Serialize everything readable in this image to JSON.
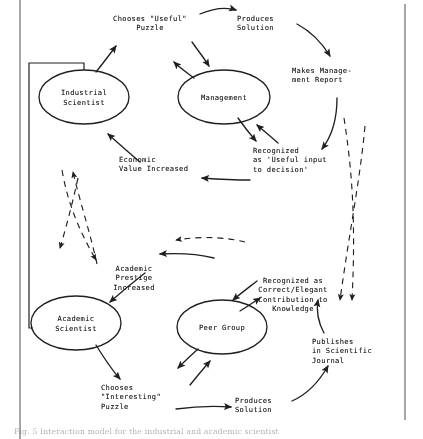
{
  "figure": {
    "background": "#ffffff",
    "ink_color": "#23211f",
    "width": 423,
    "height": 439
  },
  "nodes": [
    {
      "id": "industrial-scientist",
      "label": "Industrial\nScientist",
      "cx": 84,
      "cy": 97,
      "rx": 45,
      "ry": 27
    },
    {
      "id": "management",
      "label": "Management",
      "cx": 224,
      "cy": 97,
      "rx": 46,
      "ry": 27
    },
    {
      "id": "academic-scientist",
      "label": "Academic\nScientist",
      "cx": 76,
      "cy": 323,
      "rx": 45,
      "ry": 27
    },
    {
      "id": "peer-group",
      "label": "Peer Group",
      "cx": 222,
      "cy": 327,
      "rx": 45,
      "ry": 27
    }
  ],
  "labels": [
    {
      "id": "chooses-useful-puzzle",
      "text": "Chooses \"Useful\"\nPuzzle",
      "x": 102,
      "y": 14,
      "w": 96,
      "align": "center"
    },
    {
      "id": "produces-solution-top",
      "text": "Produces\nSolution",
      "x": 237,
      "y": 14,
      "w": 56,
      "align": "left"
    },
    {
      "id": "makes-management-report",
      "text": "Makes Manage-\nment Report",
      "x": 292,
      "y": 66,
      "w": 92,
      "align": "left"
    },
    {
      "id": "recognized-useful-input",
      "text": "Recognized\nas 'Useful input\nto decision'",
      "x": 253,
      "y": 146,
      "w": 100,
      "align": "left"
    },
    {
      "id": "economic-value-increased",
      "text": "Economic\nValue Increased",
      "x": 119,
      "y": 155,
      "w": 96,
      "align": "left"
    },
    {
      "id": "academic-prestige",
      "text": "Academic\nPrestige\nIncreased",
      "x": 98,
      "y": 264,
      "w": 70,
      "align": "center"
    },
    {
      "id": "recognized-correct",
      "text": "Recognized as\nCorrect/Elegant\nContribution to\nKnowledge",
      "x": 241,
      "y": 276,
      "w": 100,
      "align": "center"
    },
    {
      "id": "publishes-journal",
      "text": "Publishes\nin Scientific\nJournal",
      "x": 312,
      "y": 337,
      "w": 82,
      "align": "left"
    },
    {
      "id": "chooses-interesting",
      "text": "Chooses\n\"Interesting\"\nPuzzle",
      "x": 101,
      "y": 383,
      "w": 86,
      "align": "left"
    },
    {
      "id": "produces-solution-bottom",
      "text": "Produces\nSolution",
      "x": 235,
      "y": 396,
      "w": 56,
      "align": "left"
    }
  ],
  "caption": {
    "text": "Fig. 5  Interaction model for the industrial and academic scientist"
  },
  "flows": [
    {
      "from": "industrial-scientist",
      "to": "chooses-useful-puzzle",
      "style": "solid"
    },
    {
      "from": "chooses-useful-puzzle",
      "to": "produces-solution-top",
      "style": "solid"
    },
    {
      "from": "produces-solution-top",
      "to": "makes-management-report",
      "style": "solid"
    },
    {
      "from": "management",
      "to": "chooses-useful-puzzle",
      "style": "solid"
    },
    {
      "from": "chooses-useful-puzzle",
      "to": "management",
      "style": "solid"
    },
    {
      "from": "makes-management-report",
      "to": "recognized-useful-input",
      "style": "solid"
    },
    {
      "from": "management",
      "to": "recognized-useful-input",
      "style": "solid"
    },
    {
      "from": "recognized-useful-input",
      "to": "management",
      "style": "solid"
    },
    {
      "from": "recognized-useful-input",
      "to": "economic-value-increased",
      "style": "solid"
    },
    {
      "from": "economic-value-increased",
      "to": "industrial-scientist",
      "style": "solid"
    },
    {
      "from": "academic-scientist",
      "to": "chooses-interesting",
      "style": "solid"
    },
    {
      "from": "chooses-interesting",
      "to": "produces-solution-bottom",
      "style": "solid"
    },
    {
      "from": "produces-solution-bottom",
      "to": "publishes-journal",
      "style": "solid"
    },
    {
      "from": "peer-group",
      "to": "chooses-interesting",
      "style": "solid"
    },
    {
      "from": "chooses-interesting",
      "to": "peer-group",
      "style": "solid"
    },
    {
      "from": "publishes-journal",
      "to": "recognized-correct",
      "style": "solid"
    },
    {
      "from": "recognized-correct",
      "to": "peer-group",
      "style": "solid"
    },
    {
      "from": "peer-group",
      "to": "recognized-correct",
      "style": "solid"
    },
    {
      "from": "recognized-correct",
      "to": "academic-prestige",
      "style": "solid"
    },
    {
      "from": "academic-prestige",
      "to": "academic-scientist",
      "style": "solid"
    },
    {
      "from": "industrial-scientist",
      "to": "academic-prestige",
      "style": "dashed"
    },
    {
      "from": "academic-scientist",
      "to": "economic-value-increased",
      "style": "dashed"
    },
    {
      "from": "recognized-useful-input",
      "to": "publishes-journal",
      "style": "dashed"
    },
    {
      "from": "recognized-correct",
      "to": "recognized-useful-input",
      "style": "dashed"
    },
    {
      "from": "recognized-correct",
      "to": "academic-prestige",
      "style": "dashed"
    }
  ]
}
